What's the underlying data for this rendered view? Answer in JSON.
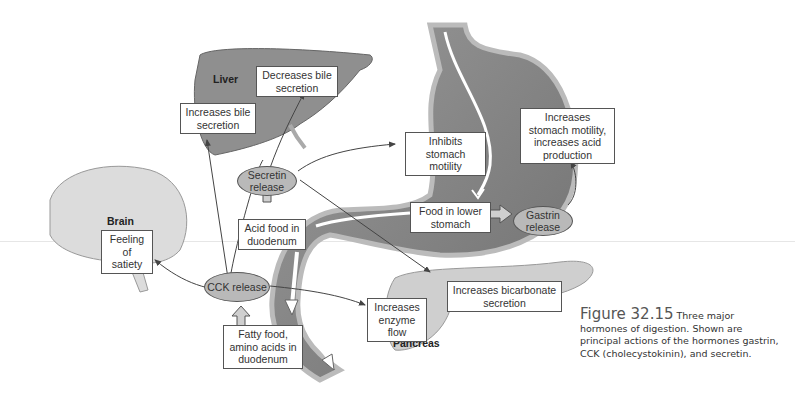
{
  "organs": {
    "liver": "Liver",
    "brain": "Brain",
    "pancreas": "Pancreas"
  },
  "hormones": {
    "secretin": "Secretin release",
    "cck": "CCK release",
    "gastrin": "Gastrin release"
  },
  "stimuli": {
    "acid_food": "Acid food in duodenum",
    "fatty_food": "Fatty food, amino acids in duodenum",
    "food_lower_stomach": "Food in lower stomach"
  },
  "effects": {
    "increases_bile": "Increases bile secretion",
    "decreases_bile": "Decreases bile secretion",
    "inhibits_stomach": "Inhibits stomach motility",
    "increases_stomach": "Increases stomach motility, increases acid production",
    "satiety": "Feeling of satiety",
    "enzyme_flow": "Increases enzyme flow",
    "bicarbonate": "Increases bicarbonate secretion"
  },
  "caption": {
    "figure_number": "Figure 32.15",
    "text": "Three major hormones of digestion. Shown are principal actions of the hormones gastrin, CCK (cholecystokinin), and secretin."
  },
  "colors": {
    "organ_fill": "#8f8f8f",
    "hormone_fill": "#b9b9b9",
    "arrow": "#444444"
  }
}
